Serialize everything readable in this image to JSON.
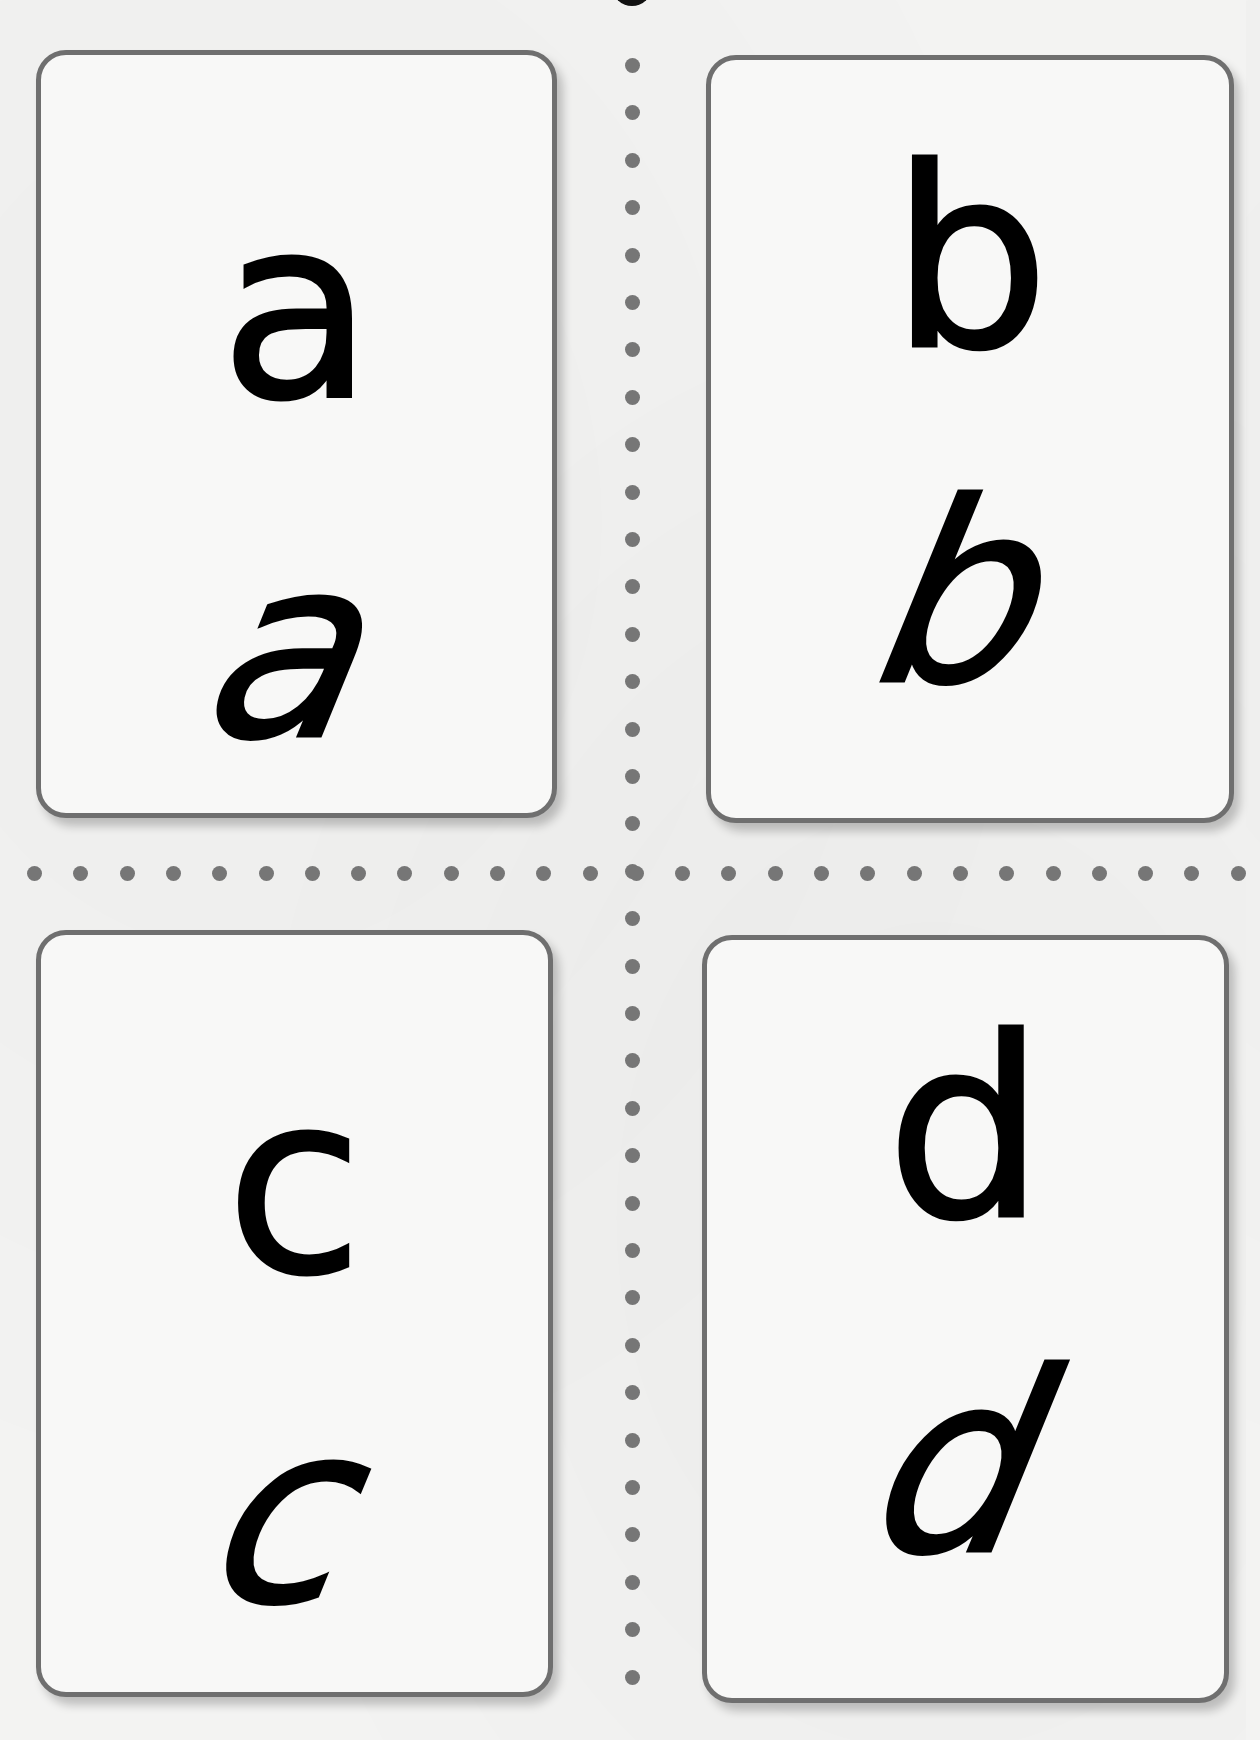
{
  "sheet": {
    "title": "",
    "cards": [
      {
        "position": "top-left",
        "print_letter": "a",
        "cursive_letter": "a"
      },
      {
        "position": "top-right",
        "print_letter": "b",
        "cursive_letter": "b"
      },
      {
        "position": "bottom-left",
        "print_letter": "c",
        "cursive_letter": "c"
      },
      {
        "position": "bottom-right",
        "print_letter": "d",
        "cursive_letter": "d"
      }
    ],
    "cut_lines": {
      "style": "dotted",
      "dot_color": "#767676",
      "vertical_x": 632,
      "horizontal_y": 873
    },
    "colors": {
      "card_border": "#6f6f6f",
      "card_background": "#f8f8f7",
      "page_background": "#f3f3f2",
      "letter": "#000000"
    }
  }
}
